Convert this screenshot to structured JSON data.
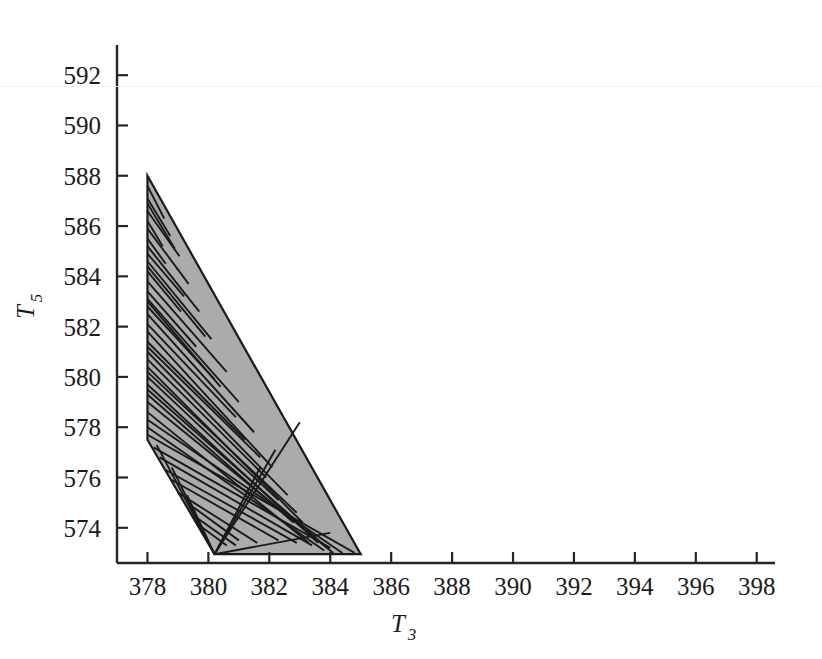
{
  "figure": {
    "background_color": "#ffffff",
    "axis_color": "#262626",
    "region_fill_color": "#ababab",
    "region_edge_color": "#1a1a1a",
    "artifact_line_color": "#f2f0f0"
  },
  "chart_data": {
    "type": "area",
    "title": "",
    "subtitle": "",
    "xlabel": "T",
    "xlabel_sub": "3",
    "ylabel": "T",
    "ylabel_sub": "5",
    "xlim": [
      377.0,
      398.6
    ],
    "ylim": [
      572.6,
      593.2
    ],
    "xticks": [
      378,
      380,
      382,
      384,
      386,
      388,
      390,
      392,
      394,
      396,
      398
    ],
    "yticks": [
      574,
      576,
      578,
      580,
      582,
      584,
      586,
      588,
      590,
      592
    ],
    "xticklabels": [
      "378",
      "380",
      "382",
      "384",
      "386",
      "388",
      "390",
      "392",
      "394",
      "396",
      "398"
    ],
    "yticklabels": [
      "574",
      "576",
      "578",
      "580",
      "582",
      "584",
      "586",
      "588",
      "590",
      "592"
    ],
    "grid": false,
    "legend": null,
    "legend_position": "none",
    "annotations": [],
    "series": [
      {
        "name": "feasible-region",
        "type": "polygon",
        "fill": "#ababab",
        "edge": "#1a1a1a",
        "vertices": [
          [
            378.0,
            588.0
          ],
          [
            385.0,
            572.95
          ],
          [
            380.2,
            572.95
          ],
          [
            378.0,
            577.5
          ]
        ]
      },
      {
        "name": "interior-chords",
        "type": "segments",
        "color": "#1a1a1a",
        "segments": [
          [
            378.0,
            587.6,
            378.55,
            586.3
          ],
          [
            378.0,
            587.1,
            378.75,
            585.6
          ],
          [
            378.0,
            586.6,
            379.05,
            584.8
          ],
          [
            378.0,
            586.2,
            378.5,
            585.2
          ],
          [
            378.0,
            585.9,
            379.35,
            583.7
          ],
          [
            378.0,
            585.5,
            378.6,
            584.5
          ],
          [
            378.0,
            585.2,
            379.7,
            582.6
          ],
          [
            378.0,
            584.9,
            379.2,
            583.2
          ],
          [
            378.0,
            584.6,
            380.1,
            581.5
          ],
          [
            378.0,
            584.2,
            379.1,
            582.6
          ],
          [
            378.0,
            583.8,
            380.6,
            580.2
          ],
          [
            378.0,
            583.4,
            379.6,
            581.2
          ],
          [
            378.0,
            583.1,
            381.0,
            579.0
          ],
          [
            378.0,
            582.8,
            380.2,
            579.9
          ],
          [
            378.0,
            582.5,
            381.5,
            577.8
          ],
          [
            378.0,
            582.1,
            380.9,
            578.4
          ],
          [
            378.0,
            581.8,
            382.1,
            576.4
          ],
          [
            378.0,
            581.4,
            381.2,
            577.5
          ],
          [
            378.0,
            581.0,
            382.6,
            575.3
          ],
          [
            378.0,
            580.7,
            381.9,
            576.0
          ],
          [
            378.0,
            580.4,
            383.1,
            574.2
          ],
          [
            378.0,
            580.0,
            382.3,
            575.1
          ],
          [
            378.0,
            579.7,
            383.6,
            573.4
          ],
          [
            378.0,
            579.3,
            382.8,
            574.2
          ],
          [
            378.0,
            579.0,
            384.1,
            573.0
          ],
          [
            378.0,
            578.6,
            383.3,
            573.4
          ],
          [
            378.0,
            578.3,
            384.4,
            573.0
          ],
          [
            378.0,
            578.0,
            383.8,
            573.1
          ],
          [
            378.0,
            577.7,
            384.8,
            573.0
          ],
          [
            378.2,
            577.2,
            384.0,
            573.2
          ],
          [
            378.4,
            576.8,
            383.4,
            573.3
          ],
          [
            378.6,
            576.3,
            382.9,
            573.4
          ],
          [
            378.8,
            575.9,
            382.3,
            573.5
          ],
          [
            379.0,
            575.4,
            381.6,
            573.4
          ],
          [
            379.3,
            575.0,
            381.0,
            573.5
          ],
          [
            379.5,
            574.5,
            380.9,
            573.3
          ],
          [
            379.7,
            574.1,
            380.6,
            573.3
          ],
          [
            380.2,
            572.95,
            381.7,
            576.4
          ],
          [
            380.2,
            572.95,
            382.2,
            577.1
          ],
          [
            380.2,
            572.95,
            383.0,
            578.2
          ],
          [
            380.2,
            572.95,
            379.3,
            575.3
          ],
          [
            380.2,
            572.95,
            378.8,
            576.4
          ],
          [
            380.2,
            572.95,
            378.3,
            577.3
          ],
          [
            380.2,
            572.95,
            384.0,
            573.8
          ],
          [
            378.0,
            584.4,
            379.9,
            581.6
          ],
          [
            378.0,
            583.0,
            380.4,
            579.6
          ],
          [
            378.0,
            581.2,
            381.7,
            576.8
          ],
          [
            378.0,
            580.2,
            382.9,
            574.6
          ],
          [
            378.0,
            579.5,
            383.9,
            573.2
          ],
          [
            378.0,
            586.9,
            378.9,
            585.1
          ]
        ]
      }
    ]
  },
  "axes": {
    "x_axis_name": "x-axis",
    "y_axis_name": "y-axis",
    "tick_direction": "in"
  }
}
